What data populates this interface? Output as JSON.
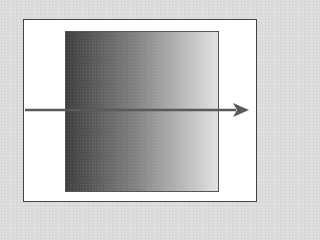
{
  "diagram": {
    "colors": {
      "background": "#dcdcdc",
      "frame_fill": "#ffffff",
      "frame_border": "#444444",
      "gradient_start": "#444444",
      "gradient_end": "#f2f2f2",
      "arrow": "#5a5a5a"
    },
    "gradient": {
      "direction": "left-to-right",
      "start_label": "",
      "end_label": ""
    },
    "arrow": {
      "direction": "right",
      "from_x": 25,
      "to_x": 248,
      "y": 110
    }
  }
}
